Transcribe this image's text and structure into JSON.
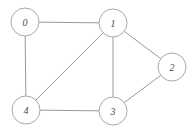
{
  "figure": {
    "title": "",
    "background_color": "#ffffff",
    "width": 195,
    "height": 129
  },
  "style": {
    "node_fill": "#ffffff",
    "node_stroke": "#a8a8a8",
    "node_radius": 14,
    "edge_color": "#9a9a9a",
    "label_color": "#4a4a4a"
  },
  "chart_data": {
    "type": "diagram",
    "graph_type": "undirected-graph",
    "title": "",
    "xlabel": "",
    "ylabel": "",
    "nodes": [
      {
        "id": "0",
        "label": "0",
        "x": 25,
        "y": 22
      },
      {
        "id": "1",
        "label": "1",
        "x": 113,
        "y": 23
      },
      {
        "id": "2",
        "label": "2",
        "x": 172,
        "y": 67
      },
      {
        "id": "3",
        "label": "3",
        "x": 113,
        "y": 111
      },
      {
        "id": "4",
        "label": "4",
        "x": 26,
        "y": 110
      }
    ],
    "edges": [
      {
        "source": "0",
        "target": "1"
      },
      {
        "source": "0",
        "target": "4"
      },
      {
        "source": "1",
        "target": "4"
      },
      {
        "source": "1",
        "target": "3"
      },
      {
        "source": "1",
        "target": "2"
      },
      {
        "source": "2",
        "target": "3"
      },
      {
        "source": "3",
        "target": "4"
      }
    ],
    "node_count": 5,
    "edge_count": 7
  }
}
